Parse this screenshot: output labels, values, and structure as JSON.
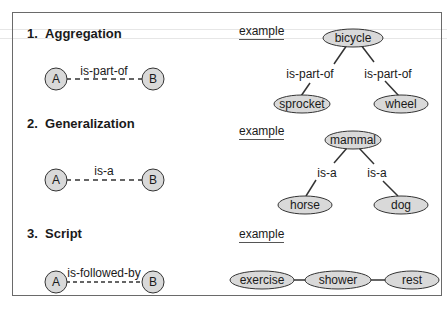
{
  "sections": [
    {
      "number": "1.",
      "title": "Aggregation",
      "generic": {
        "from": "A",
        "to": "B",
        "relation": "is-part-of"
      },
      "example_label": "example",
      "example": {
        "root": "bicycle",
        "children": [
          "sprocket",
          "wheel"
        ],
        "relations": [
          "is-part-of",
          "is-part-of"
        ]
      }
    },
    {
      "number": "2.",
      "title": "Generalization",
      "generic": {
        "from": "A",
        "to": "B",
        "relation": "is-a"
      },
      "example_label": "example",
      "example": {
        "root": "mammal",
        "children": [
          "horse",
          "dog"
        ],
        "relations": [
          "is-a",
          "is-a"
        ]
      }
    },
    {
      "number": "3.",
      "title": "Script",
      "generic": {
        "from": "A",
        "to": "B",
        "relation": "is-followed-by"
      },
      "example_label": "example",
      "example": {
        "chain": [
          "exercise",
          "shower",
          "rest"
        ]
      }
    }
  ],
  "colors": {
    "node_fill": "#d9d9d9",
    "stroke": "#333333",
    "frame": "#6a6a6a"
  }
}
